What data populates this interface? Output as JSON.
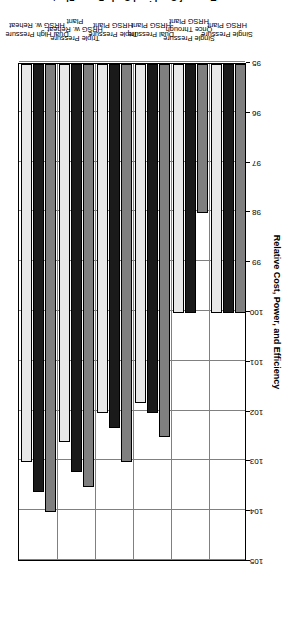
{
  "chart_data": {
    "type": "bar",
    "orientation": "vertical-rendered-rotated",
    "title": "",
    "xlabel": "Types of Combined Cycle Power Plants",
    "ylabel": "Relative Cost, Power, and Efficiency",
    "ylim": [
      95,
      105
    ],
    "ytick_step": 1,
    "yticks": [
      95,
      96,
      97,
      98,
      99,
      100,
      101,
      102,
      103,
      104,
      105
    ],
    "ytick_labels": [
      "95",
      "96",
      "97",
      "98",
      "99",
      "100",
      "101",
      "102",
      "103",
      "104",
      "105"
    ],
    "grid": true,
    "grid_axis": "y",
    "legend_position": "top-center",
    "categories": [
      "Single Pressure\nHRSG Plant",
      "Single Pressure\nOnce Through\nHRSG Plant",
      "Dual Pressure\nHRSG Plant",
      "Triple Pressure\nHRSG Plant",
      "Triple Pressure\nHRSG w. Reheat\nPlant",
      "Dual High Pressure\nHRSG w. Reheat"
    ],
    "category_lines": [
      [
        "Single Pressure",
        "HRSG Plant"
      ],
      [
        "Single Pressure",
        "Once Through",
        "HRSG Plant"
      ],
      [
        "Dual Pressure",
        "HRSG Plant"
      ],
      [
        "Triple Pressure",
        "HRSG Plant"
      ],
      [
        "Triple Pressure",
        "HRSG w. Reheat",
        "Plant"
      ],
      [
        "Dual High Pressure",
        "HRSG w. Reheat"
      ]
    ],
    "series": [
      {
        "name": "Relative Price",
        "legend_lines": [
          "Relative",
          "Price"
        ],
        "color": "#7f7f7f",
        "values": [
          100.0,
          98.0,
          102.5,
          103.0,
          103.5,
          104.0
        ]
      },
      {
        "name": "Relative Net Output",
        "legend_lines": [
          "Relative",
          "Net Output"
        ],
        "color": "#1a1a1a",
        "values": [
          100.0,
          100.0,
          102.0,
          102.3,
          103.2,
          103.6
        ]
      },
      {
        "name": "Relative Net Efficiency",
        "legend_lines": [
          "Relative",
          "Net Efficiency"
        ],
        "color": "#e8e8e8",
        "values": [
          100.0,
          100.0,
          101.8,
          102.0,
          102.6,
          103.0
        ]
      }
    ]
  },
  "axis": {
    "y_title": "Relative Cost, Power, and Efficiency",
    "x_title": "Types of Combined Cycle Power Plants"
  },
  "legend": {
    "entries": [
      {
        "l1": "Relative",
        "l2": "Price"
      },
      {
        "l1": "Relative",
        "l2": "Net Output"
      },
      {
        "l1": "Relative",
        "l2": "Net Efficiency"
      }
    ]
  }
}
